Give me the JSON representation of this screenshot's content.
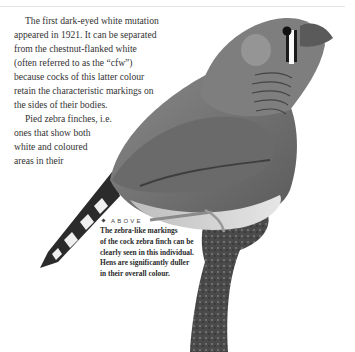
{
  "page": {
    "body_paragraphs": [
      {
        "lines": [
          "The first dark-eyed white mutation",
          "appeared in 1921. It can be separated",
          "from the chestnut-flanked white",
          "(often referred to as the “cfw”)",
          "because cocks of this latter colour",
          "retain the characteristic markings on",
          "the sides of their bodies."
        ]
      },
      {
        "lines": [
          "Pied zebra finches, i.e.",
          "ones that show both",
          "white and coloured",
          "areas in their"
        ]
      }
    ],
    "image": {
      "subject": "zebra finch cock perched on branch",
      "icon": "bird-photo"
    },
    "caption": {
      "label": "ABOVE",
      "lines": [
        "The zebra-like markings",
        "of the cock zebra finch can be",
        "clearly seen in this individual.",
        "Hens are significantly duller",
        "in their overall colour."
      ]
    },
    "colors": {
      "rule": "#e4e4e4",
      "text": "#333333",
      "bird_body": "#7a7a7a",
      "branch": "#3a3a3a"
    }
  }
}
